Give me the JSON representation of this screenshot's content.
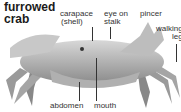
{
  "title": {
    "line1": "furrowed",
    "line2": "crab"
  },
  "labels": {
    "carapace": "carapace",
    "shell": "(shell)",
    "eye1": "eye on",
    "eye2": "stalk",
    "pincer": "pincer",
    "walking": "walking",
    "leg": "leg",
    "abdomen": "abdomen",
    "mouth": "mouth"
  }
}
